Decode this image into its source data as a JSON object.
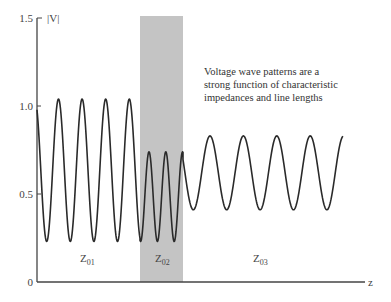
{
  "chart_data": {
    "type": "line",
    "title": "",
    "xlabel": "z",
    "ylabel": "|V|",
    "ylim": [
      0,
      1.5
    ],
    "yticks": [
      0,
      0.5,
      1.0,
      1.5
    ],
    "ytick_labels": [
      "0",
      "0.5",
      "1.0",
      "1.5"
    ],
    "grid": false,
    "legend": null,
    "annotation": "Voltage wave patterns are a strong function of characteristic impedances and line lengths",
    "sections": [
      {
        "name": "Z01",
        "label_main": "Z",
        "label_sub": "01",
        "shaded": false,
        "z_start": 0,
        "z_end": 0.31,
        "vmax": 1.04,
        "vmin": 0.23,
        "peaks": 4
      },
      {
        "name": "Z02",
        "label_main": "Z",
        "label_sub": "02",
        "shaded": true,
        "z_start": 0.31,
        "z_end": 0.45,
        "vmax": 0.74,
        "vmin": 0.23,
        "peaks": 3
      },
      {
        "name": "Z03",
        "label_main": "Z",
        "label_sub": "03",
        "shaded": false,
        "z_start": 0.45,
        "z_end": 0.94,
        "vmax": 0.83,
        "vmin": 0.41,
        "peaks": 5
      }
    ],
    "series": [
      {
        "name": "|V(z)|",
        "description": "standing-wave voltage magnitude along z, piecewise |cos| pattern per line section"
      }
    ]
  },
  "axes": {
    "y_label": "|V|",
    "x_label": "z",
    "ticks": {
      "t0": "0",
      "t05": "0.5",
      "t10": "1.0",
      "t15": "1.5"
    }
  },
  "annotation": {
    "line1": "Voltage wave patterns are a",
    "line2": "strong function of characteristic",
    "line3": "impedances and line lengths"
  },
  "labels": {
    "z01_main": "Z",
    "z01_sub": "01",
    "z02_main": "Z",
    "z02_sub": "02",
    "z03_main": "Z",
    "z03_sub": "03"
  },
  "colors": {
    "curve": "#2a2a2a",
    "axis": "#444444",
    "shade": "#c4c4c4"
  }
}
